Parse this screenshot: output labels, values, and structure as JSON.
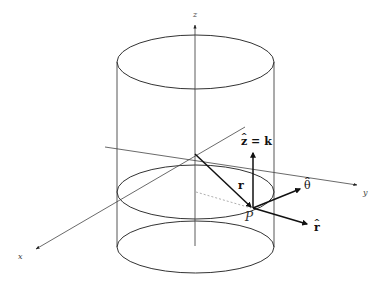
{
  "diagram": {
    "axes": {
      "x_label": "x",
      "y_label": "y",
      "z_label": "z"
    },
    "point_label": "P",
    "vectors": {
      "position": {
        "label": "r"
      },
      "z_hat": {
        "label_base": "z",
        "label_rest": " = k"
      },
      "theta_hat": {
        "label_base": "θ"
      },
      "r_hat": {
        "label_base": "r"
      }
    },
    "cylinder": {
      "sections": [
        "top-ellipse",
        "middle-ellipse",
        "bottom-ellipse"
      ],
      "guide_line": "dashed"
    },
    "colors": {
      "line": "#333333",
      "thin_line": "#555555",
      "dashed": "#999999",
      "background": "#ffffff"
    }
  }
}
